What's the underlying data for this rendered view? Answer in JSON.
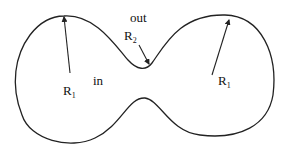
{
  "diagram": {
    "type": "dumbbell-shaped closed curve (membrane/vesicle with neck)",
    "stroke_color": "#222222",
    "labels": {
      "outside": "out",
      "inside": "in",
      "left_radius": {
        "main": "R",
        "sub": "1"
      },
      "right_radius": {
        "main": "R",
        "sub": "1"
      },
      "neck_radius": {
        "main": "R",
        "sub": "2"
      }
    },
    "arrows": [
      {
        "name": "left-R1-arrow",
        "from": [
          70,
          73
        ],
        "to": [
          64,
          16
        ]
      },
      {
        "name": "right-R1-arrow",
        "from": [
          212,
          75
        ],
        "to": [
          229,
          19
        ]
      },
      {
        "name": "R2-arrow",
        "from": [
          138,
          44
        ],
        "to": [
          149,
          65
        ]
      }
    ]
  }
}
